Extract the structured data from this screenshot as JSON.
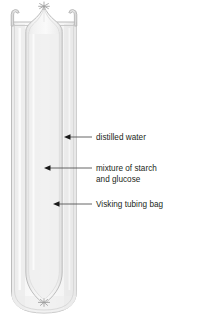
{
  "diagram": {
    "type": "science-apparatus-diagram",
    "canvas": {
      "width": 207,
      "height": 324
    },
    "background_color": "#ffffff",
    "colors": {
      "outline": "#b8b8b8",
      "outline_dark": "#a0a0a0",
      "glass_fill": "#f2f2f2",
      "water_fill": "#ededed",
      "bag_fill": "#e8e8e8",
      "arrow": "#231f20",
      "leader_line": "#6f6f6f",
      "text": "#231f20"
    },
    "apparatus": {
      "test_tube": {
        "name": "test tube",
        "left": 10,
        "right": 78,
        "top": 10,
        "bottom": 313,
        "rim_flare": "outward-hook"
      },
      "visking_bag": {
        "name": "Visking tubing bag",
        "left": 24,
        "right": 65,
        "top_apex_y": 6,
        "bottom_tie_y": 303,
        "top_tie": "knot",
        "bottom_tie": "knot"
      }
    },
    "labels": [
      {
        "id": "distilled-water",
        "text": "distilled water",
        "text_x": 96,
        "text_y": 139,
        "arrow_tip_x": 66,
        "arrow_tail_x": 92,
        "arrow_y": 137
      },
      {
        "id": "mixture-starch-glucose",
        "text_lines": [
          "mixture of starch",
          "and glucose"
        ],
        "text_x": 96,
        "text_y": 170,
        "line_height": 11,
        "arrow_tip_x": 45,
        "arrow_tail_x": 92,
        "arrow_y": 168
      },
      {
        "id": "visking-tubing-bag",
        "text": "Visking tubing bag",
        "text_x": 96,
        "text_y": 206,
        "arrow_tip_x": 54,
        "arrow_tail_x": 92,
        "arrow_y": 204
      }
    ]
  }
}
